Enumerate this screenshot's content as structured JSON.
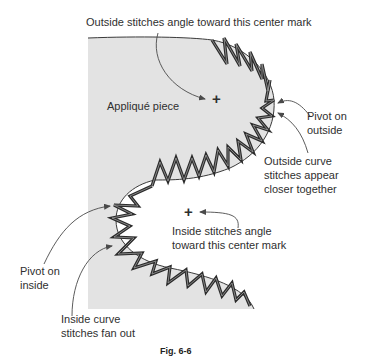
{
  "figure": {
    "caption": "Fig. 6-6",
    "colors": {
      "fill": "#e3e3e3",
      "outline": "#3a3a3a",
      "stitch": "#2b2b2b",
      "stitch_highlight": "#9a9a9a",
      "arrow": "#4a4a4a",
      "text": "#2f2f2f"
    }
  },
  "labels": {
    "outside_center": "Outside stitches angle toward this center mark",
    "applique_piece": "Appliqué piece",
    "pivot_outside_1": "Pivot on",
    "pivot_outside_2": "outside",
    "outside_curve_1": "Outside curve",
    "outside_curve_2": "stitches appear",
    "outside_curve_3": "closer together",
    "inside_center_1": "Inside stitches angle",
    "inside_center_2": "toward this center mark",
    "pivot_inside_1": "Pivot on",
    "pivot_inside_2": "inside",
    "inside_curve_1": "Inside curve",
    "inside_curve_2": "stitches fan out"
  },
  "marks": {
    "outside_center_mark": "+",
    "inside_center_mark": "+"
  }
}
